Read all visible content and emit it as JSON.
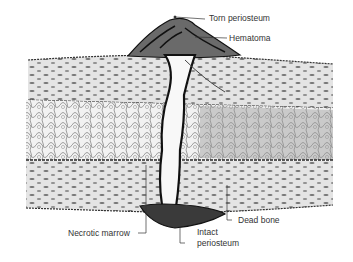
{
  "figure": {
    "labels": [
      {
        "id": "torn-periosteum",
        "text": "Torn periosteum"
      },
      {
        "id": "hematoma",
        "text": "Hematoma"
      },
      {
        "id": "dead-bone",
        "text": "Dead bone"
      },
      {
        "id": "necrotic-marrow",
        "text": "Necrotic marrow"
      },
      {
        "id": "intact-periosteum-line1",
        "text": "Intact"
      },
      {
        "id": "intact-periosteum-line2",
        "text": "periosteum"
      }
    ],
    "colors": {
      "ink": "#1a1a1a",
      "cortex_fill": "#e4e4e4",
      "marrow_fill": "#d2d2d2",
      "hematoma_fill": "#555555",
      "label_text": "#333333"
    }
  }
}
